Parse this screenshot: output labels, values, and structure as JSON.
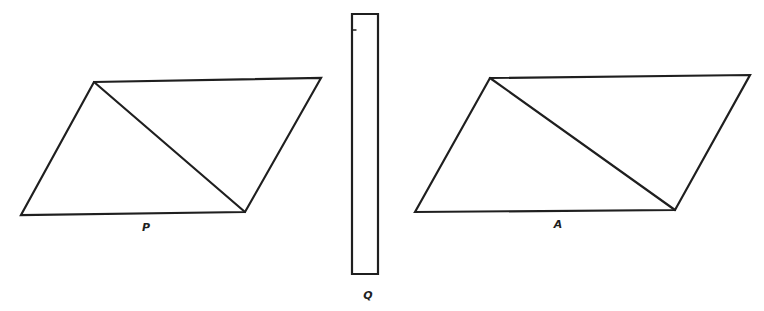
{
  "diagram": {
    "colors": {
      "stroke": "#1f1f1f",
      "background": "#ffffff"
    },
    "figures": [
      {
        "id": "P",
        "label": "P",
        "shape": "parallelogram",
        "vertices": [
          [
            21,
            215
          ],
          [
            94,
            82
          ],
          [
            321,
            78
          ],
          [
            245,
            212
          ]
        ],
        "diagonal": [
          [
            94,
            82
          ],
          [
            245,
            212
          ]
        ],
        "label_pos": [
          146,
          231
        ]
      },
      {
        "id": "Q",
        "label": "Q",
        "shape": "rectangle",
        "vertices": [
          [
            352,
            14
          ],
          [
            378,
            14
          ],
          [
            378,
            274
          ],
          [
            352,
            274
          ]
        ],
        "tick": [
          [
            352,
            30
          ],
          [
            356,
            30
          ]
        ],
        "label_pos": [
          368,
          299
        ]
      },
      {
        "id": "A",
        "label": "A",
        "shape": "parallelogram",
        "vertices": [
          [
            415,
            212
          ],
          [
            490,
            78
          ],
          [
            750,
            75
          ],
          [
            675,
            210
          ]
        ],
        "diagonal": [
          [
            490,
            78
          ],
          [
            675,
            210
          ]
        ],
        "label_pos": [
          558,
          228
        ]
      }
    ]
  }
}
